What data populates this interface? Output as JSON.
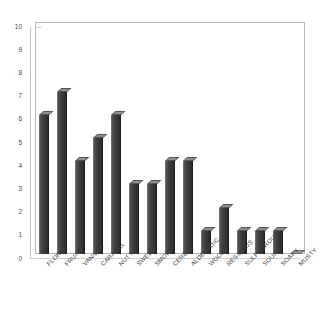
{
  "chart_data": {
    "type": "bar",
    "title": "",
    "subtitle": "",
    "xlabel": "",
    "ylabel": "",
    "ylim": [
      0,
      10
    ],
    "yticks": [
      0,
      1,
      2,
      3,
      4,
      5,
      6,
      7,
      8,
      9,
      10
    ],
    "grid": false,
    "legend": false,
    "legend_position": "none",
    "categories": [
      "FLORAL",
      "FRUITY",
      "VANILLA",
      "CARAMEL",
      "NUTTY",
      "SWEET",
      "SMOKY",
      "CEREAL",
      "ALDEHYDIC",
      "WOODY",
      "RESINOUS",
      "SULPHUROUS",
      "SOUR",
      "SOAPY",
      "MUSTY"
    ],
    "values": [
      6,
      7,
      4,
      5,
      6,
      3,
      3,
      4,
      4,
      1,
      2,
      1,
      1,
      1,
      0
    ],
    "bar_color": "#3b3b3b",
    "axis_color": "#b9b9b9",
    "tick_label_color": "#4a4a4a"
  }
}
